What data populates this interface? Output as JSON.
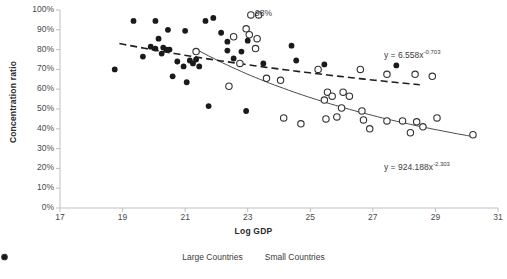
{
  "chart_data": {
    "type": "scatter",
    "title": "",
    "xlabel": "Log GDP",
    "ylabel": "Concentration ratio",
    "xlim": [
      17,
      31
    ],
    "ylim": [
      0,
      1
    ],
    "xticks": [
      "17",
      "19",
      "21",
      "23",
      "25",
      "27",
      "29",
      "31"
    ],
    "xtick_values": [
      17,
      19,
      21,
      23,
      25,
      27,
      29,
      31
    ],
    "yticks": [
      "0%",
      "10%",
      "20%",
      "30%",
      "40%",
      "50%",
      "60%",
      "70%",
      "80%",
      "90%",
      "100%"
    ],
    "ytick_values": [
      0,
      0.1,
      0.2,
      0.3,
      0.4,
      0.5,
      0.6,
      0.7,
      0.8,
      0.9,
      1.0
    ],
    "grid": false,
    "legend_position": "bottom",
    "annotations": [
      {
        "text": "98%",
        "x": 23.35,
        "y": 0.975,
        "name": "annotation-98-percent"
      }
    ],
    "series": [
      {
        "name": "Large Countries",
        "marker": "open-circle",
        "color": "#333333",
        "points": [
          [
            23.1,
            0.975
          ],
          [
            22.95,
            0.905
          ],
          [
            23.05,
            0.875
          ],
          [
            21.35,
            0.79
          ],
          [
            22.55,
            0.865
          ],
          [
            23.3,
            0.855
          ],
          [
            23.25,
            0.805
          ],
          [
            23.6,
            0.655
          ],
          [
            22.75,
            0.73
          ],
          [
            24.15,
            0.455
          ],
          [
            24.7,
            0.425
          ],
          [
            25.25,
            0.7
          ],
          [
            26.6,
            0.7
          ],
          [
            27.45,
            0.675
          ],
          [
            28.35,
            0.675
          ],
          [
            28.9,
            0.665
          ],
          [
            25.55,
            0.585
          ],
          [
            25.7,
            0.565
          ],
          [
            25.45,
            0.545
          ],
          [
            26.05,
            0.585
          ],
          [
            26.25,
            0.565
          ],
          [
            26.0,
            0.505
          ],
          [
            25.85,
            0.46
          ],
          [
            25.5,
            0.45
          ],
          [
            26.65,
            0.49
          ],
          [
            26.7,
            0.445
          ],
          [
            26.9,
            0.4
          ],
          [
            27.45,
            0.44
          ],
          [
            27.95,
            0.44
          ],
          [
            28.4,
            0.435
          ],
          [
            28.6,
            0.41
          ],
          [
            28.2,
            0.38
          ],
          [
            29.05,
            0.455
          ],
          [
            30.2,
            0.37
          ],
          [
            24.05,
            0.645
          ],
          [
            22.4,
            0.615
          ]
        ]
      },
      {
        "name": "Small Countries",
        "marker": "filled-circle",
        "color": "#1a1a1a",
        "points": [
          [
            18.75,
            0.7
          ],
          [
            19.35,
            0.945
          ],
          [
            20.05,
            0.945
          ],
          [
            20.45,
            0.9
          ],
          [
            20.15,
            0.855
          ],
          [
            21.0,
            0.895
          ],
          [
            21.65,
            0.945
          ],
          [
            21.9,
            0.96
          ],
          [
            19.9,
            0.815
          ],
          [
            20.05,
            0.805
          ],
          [
            20.3,
            0.81
          ],
          [
            20.4,
            0.8
          ],
          [
            20.25,
            0.78
          ],
          [
            20.5,
            0.8
          ],
          [
            19.65,
            0.765
          ],
          [
            20.75,
            0.74
          ],
          [
            20.95,
            0.715
          ],
          [
            21.15,
            0.745
          ],
          [
            21.35,
            0.75
          ],
          [
            21.45,
            0.715
          ],
          [
            21.25,
            0.73
          ],
          [
            20.6,
            0.665
          ],
          [
            21.05,
            0.635
          ],
          [
            22.35,
            0.795
          ],
          [
            22.35,
            0.84
          ],
          [
            22.55,
            0.755
          ],
          [
            23.0,
            0.845
          ],
          [
            22.15,
            0.885
          ],
          [
            22.8,
            0.79
          ],
          [
            23.5,
            0.73
          ],
          [
            21.75,
            0.515
          ],
          [
            22.95,
            0.49
          ],
          [
            24.55,
            0.745
          ],
          [
            24.4,
            0.82
          ],
          [
            25.45,
            0.725
          ],
          [
            27.75,
            0.72
          ]
        ]
      }
    ],
    "trendlines": [
      {
        "name": "Large Countries trendline",
        "style": "solid",
        "equation": "y = 924.188x",
        "exponent": "-2.303",
        "label_full": "y = 924.188x⁻²·³⁰³",
        "coefficient": 924.188,
        "power": -2.303
      },
      {
        "name": "Small Countries trendline",
        "style": "dashed",
        "equation": "y = 6.558x",
        "exponent": "-0.703",
        "label_full": "y = 6.558x⁻⁰·⁷⁰³",
        "coefficient": 6.558,
        "power": -0.703
      }
    ]
  },
  "legend": {
    "items": [
      {
        "label": "Large Countries",
        "marker": "open-circle"
      },
      {
        "label": "Small Countries",
        "marker": "filled-circle"
      }
    ]
  },
  "equations": {
    "large_prefix": "y = 924.188x",
    "large_exp": "-2.303",
    "small_prefix": "y = 6.558x",
    "small_exp": "-0.703"
  }
}
